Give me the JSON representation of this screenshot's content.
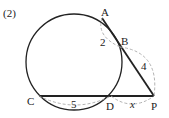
{
  "problem_number": "(2)",
  "points": {
    "A": {
      "label": "A",
      "x": 102,
      "y": 18
    },
    "B": {
      "label": "B",
      "x": 120,
      "y": 47
    },
    "C": {
      "label": "C",
      "x": 39,
      "y": 96
    },
    "D": {
      "label": "D",
      "x": 111,
      "y": 96
    },
    "P": {
      "label": "P",
      "x": 154,
      "y": 96
    }
  },
  "circle": {
    "cx": 74,
    "cy": 62,
    "r": 48
  },
  "lengths": {
    "AB": "2",
    "BP": "4",
    "CD": "5",
    "DP": "x"
  },
  "colors": {
    "stroke": "#222222",
    "dashed": "#aaaaaa"
  }
}
